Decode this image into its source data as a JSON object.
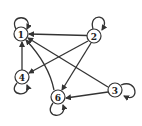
{
  "graph": {
    "type": "directed",
    "nodes": [
      {
        "id": "1",
        "label": "1",
        "x": 21,
        "y": 34
      },
      {
        "id": "2",
        "label": "2",
        "x": 94,
        "y": 36
      },
      {
        "id": "3",
        "label": "3",
        "x": 115,
        "y": 90
      },
      {
        "id": "4",
        "label": "4",
        "x": 22,
        "y": 77
      },
      {
        "id": "6",
        "label": "6",
        "x": 58,
        "y": 97
      }
    ],
    "edges": [
      {
        "from": "2",
        "to": "1"
      },
      {
        "from": "2",
        "to": "4"
      },
      {
        "from": "2",
        "to": "6"
      },
      {
        "from": "4",
        "to": "1"
      },
      {
        "from": "6",
        "to": "1"
      },
      {
        "from": "3",
        "to": "1"
      },
      {
        "from": "3",
        "to": "6"
      },
      {
        "from": "1",
        "to": "1"
      },
      {
        "from": "2",
        "to": "2"
      },
      {
        "from": "3",
        "to": "3"
      },
      {
        "from": "4",
        "to": "4"
      },
      {
        "from": "6",
        "to": "6"
      }
    ],
    "colors": {
      "stroke": "#333333",
      "fill": "#ffffff"
    }
  }
}
